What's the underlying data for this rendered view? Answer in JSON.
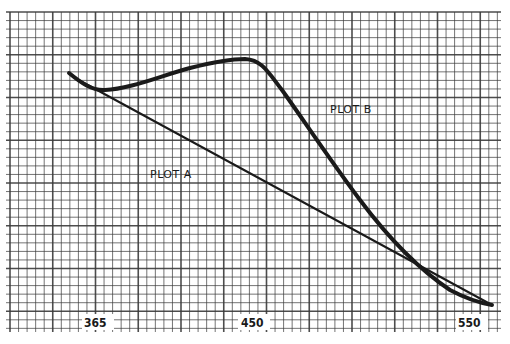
{
  "chart_data": {
    "type": "line",
    "title": "",
    "xlabel": "",
    "ylabel": "",
    "x_tick_labels": [
      "365",
      "450",
      "550"
    ],
    "grid": true,
    "legend": "inline labels",
    "series": [
      {
        "name": "PLOT A",
        "shape": "straight decreasing line",
        "x": [
          355,
          550
        ],
        "y_relative": [
          0.82,
          0.0
        ]
      },
      {
        "name": "PLOT B",
        "shape": "rises to peak then falls steeply",
        "x": [
          355,
          365,
          400,
          430,
          450,
          465,
          500,
          530,
          550
        ],
        "y_relative": [
          0.82,
          0.77,
          0.84,
          0.88,
          0.89,
          0.84,
          0.52,
          0.18,
          0.0
        ]
      }
    ]
  },
  "labels": {
    "tick_365": "365",
    "tick_450": "450",
    "tick_550": "550",
    "plot_a": "PLOT A",
    "plot_b": "PLOT B"
  },
  "colors": {
    "paper": "#ffffff",
    "grid": "#3a3a3a",
    "ink": "#1a1a1a"
  }
}
